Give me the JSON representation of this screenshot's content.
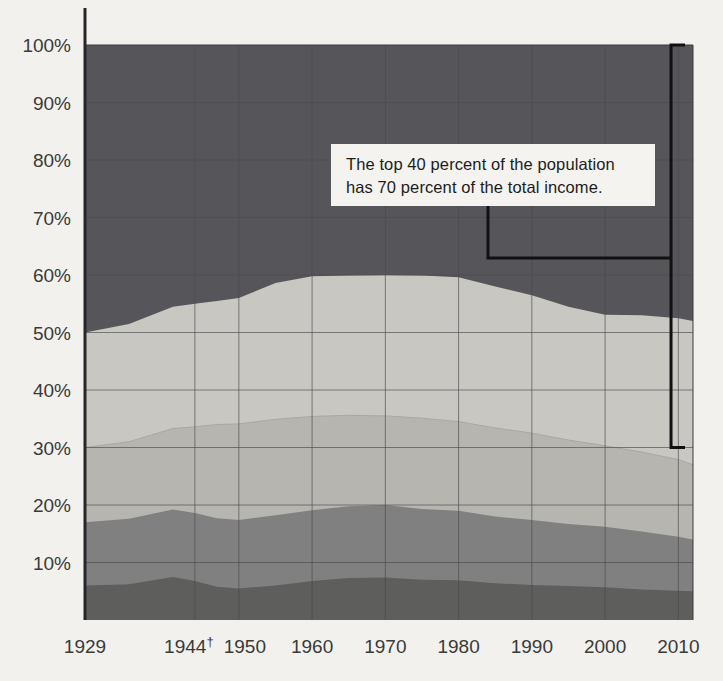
{
  "chart_data": {
    "type": "area",
    "title": "",
    "subtitle": "",
    "xlabel": "",
    "ylabel": "",
    "stacked": true,
    "normalized_percent": true,
    "grid": true,
    "legend_position": "none",
    "xlim": [
      1929,
      2012
    ],
    "ylim": [
      0,
      100
    ],
    "y_ticks": [
      "10%",
      "20%",
      "30%",
      "40%",
      "50%",
      "60%",
      "70%",
      "80%",
      "90%",
      "100%"
    ],
    "y_tick_values": [
      10,
      20,
      30,
      40,
      50,
      60,
      70,
      80,
      90,
      100
    ],
    "x_ticks": [
      "1929",
      "1944",
      "1950",
      "1960",
      "1970",
      "1980",
      "1990",
      "2000",
      "2010"
    ],
    "x_tick_values": [
      1929,
      1944,
      1950,
      1960,
      1970,
      1980,
      1990,
      2000,
      2010
    ],
    "x_tick_footnote_marker": "†",
    "x_tick_footnote_on": "1944",
    "x": [
      1929,
      1935,
      1941,
      1944,
      1947,
      1950,
      1955,
      1960,
      1965,
      1970,
      1975,
      1980,
      1985,
      1990,
      1995,
      2000,
      2005,
      2010,
      2012
    ],
    "series": [
      {
        "name": "Lowest fifth",
        "color": "#5e5e5c",
        "cumulative_top": [
          6.0,
          6.2,
          7.5,
          6.8,
          5.8,
          5.5,
          6.0,
          6.8,
          7.3,
          7.4,
          7.0,
          6.9,
          6.4,
          6.1,
          5.9,
          5.7,
          5.3,
          5.1,
          5.0
        ],
        "values": [
          6.0,
          6.2,
          7.5,
          6.8,
          5.8,
          5.5,
          6.0,
          6.8,
          7.3,
          7.4,
          7.0,
          6.9,
          6.4,
          6.1,
          5.9,
          5.7,
          5.3,
          5.1,
          5.0
        ]
      },
      {
        "name": "Second fifth",
        "color": "#808080",
        "cumulative_top": [
          17.0,
          17.6,
          19.2,
          18.6,
          17.7,
          17.4,
          18.2,
          19.1,
          19.8,
          20.0,
          19.3,
          19.0,
          18.0,
          17.4,
          16.7,
          16.2,
          15.4,
          14.5,
          14.0
        ],
        "values": [
          11.0,
          11.4,
          11.7,
          11.8,
          11.9,
          11.9,
          12.2,
          12.3,
          12.5,
          12.6,
          12.3,
          12.1,
          11.6,
          11.3,
          10.8,
          10.5,
          10.1,
          9.4,
          9.0
        ]
      },
      {
        "name": "Middle fifth",
        "color": "#b6b5b0",
        "cumulative_top": [
          30.0,
          31.0,
          33.3,
          33.6,
          34.0,
          34.1,
          34.9,
          35.4,
          35.6,
          35.5,
          35.1,
          34.5,
          33.4,
          32.5,
          31.3,
          30.3,
          29.2,
          27.9,
          27.0
        ],
        "values": [
          13.0,
          13.4,
          14.1,
          15.0,
          16.3,
          16.7,
          16.7,
          16.3,
          15.8,
          15.5,
          15.8,
          15.5,
          15.4,
          15.1,
          14.6,
          14.1,
          13.8,
          13.4,
          13.0
        ]
      },
      {
        "name": "Fourth fifth",
        "color": "#c8c7c2",
        "cumulative_top": [
          50.0,
          51.5,
          54.5,
          55.0,
          55.5,
          56.0,
          58.6,
          59.8,
          59.9,
          60.0,
          59.9,
          59.6,
          58.0,
          56.5,
          54.5,
          53.1,
          53.0,
          52.5,
          52.0
        ],
        "values": [
          20.0,
          20.5,
          21.2,
          21.4,
          21.5,
          21.9,
          23.7,
          24.4,
          24.3,
          24.5,
          24.8,
          25.1,
          24.6,
          24.0,
          23.2,
          22.8,
          23.8,
          24.6,
          25.0
        ]
      },
      {
        "name": "Highest fifth",
        "color": "#56565a",
        "cumulative_top": [
          100,
          100,
          100,
          100,
          100,
          100,
          100,
          100,
          100,
          100,
          100,
          100,
          100,
          100,
          100,
          100,
          100,
          100,
          100
        ],
        "values": [
          50.0,
          48.5,
          45.5,
          45.0,
          44.5,
          44.0,
          41.4,
          40.2,
          40.1,
          40.0,
          40.1,
          40.4,
          42.0,
          43.5,
          45.5,
          46.9,
          47.0,
          47.5,
          48.0
        ]
      }
    ],
    "annotations": [
      {
        "name": "top-40-callout",
        "text_lines": [
          "The top 40 percent of the population",
          "has 70 percent of the total income."
        ],
        "bracket_from_percent": 100,
        "bracket_to_percent": 30,
        "bracket_x_year": 2009
      }
    ]
  },
  "axis": {
    "y_labels": [
      "100%",
      "90%",
      "80%",
      "70%",
      "60%",
      "50%",
      "40%",
      "30%",
      "20%",
      "10%"
    ],
    "x_labels": [
      "1929",
      "1944",
      "1950",
      "1960",
      "1970",
      "1980",
      "1990",
      "2000",
      "2010"
    ],
    "dagger": "†"
  },
  "callout": {
    "line1": "The top 40 percent of the population",
    "line2": "has 70 percent of the total income."
  },
  "colors": {
    "background": "#f2f1ee",
    "axis": "#26262a",
    "grid": "#4a4a4d",
    "band_highest": "#56565a",
    "band_fourth": "#c8c7c2",
    "band_middle": "#b6b5b0",
    "band_second": "#808080",
    "band_lowest": "#5e5e5c",
    "callout_bg": "#f4f3f0",
    "callout_text": "#1d1d1b"
  }
}
